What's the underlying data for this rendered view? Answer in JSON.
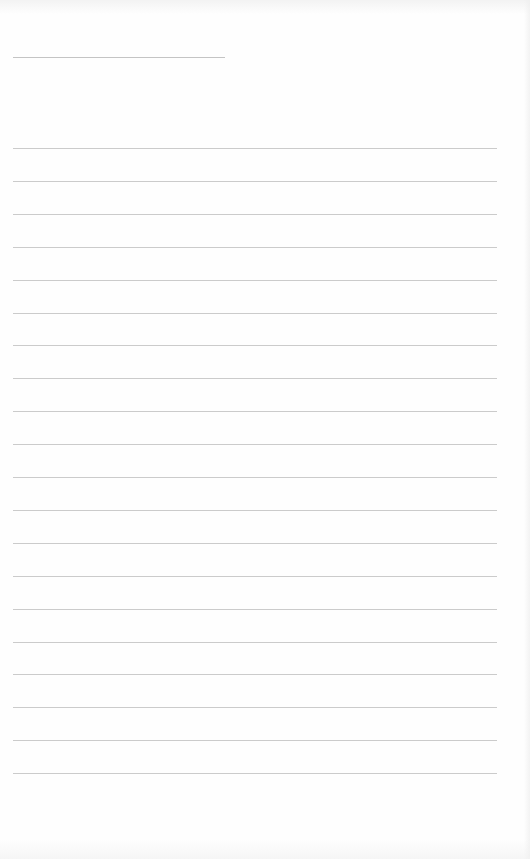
{
  "document": {
    "type": "lined-paper",
    "background_color": "#fefefe",
    "line_color": "#cbcbcb",
    "title_line": {
      "label": "",
      "x": 13,
      "y": 57,
      "width": 212,
      "color": "#c4c4c4"
    },
    "ruled_lines": {
      "count": 20,
      "start_y": 148,
      "spacing": 32.9,
      "x": 13,
      "width": 484
    },
    "lines_text": [
      "",
      "",
      "",
      "",
      "",
      "",
      "",
      "",
      "",
      "",
      "",
      "",
      "",
      "",
      "",
      "",
      "",
      "",
      "",
      ""
    ]
  }
}
